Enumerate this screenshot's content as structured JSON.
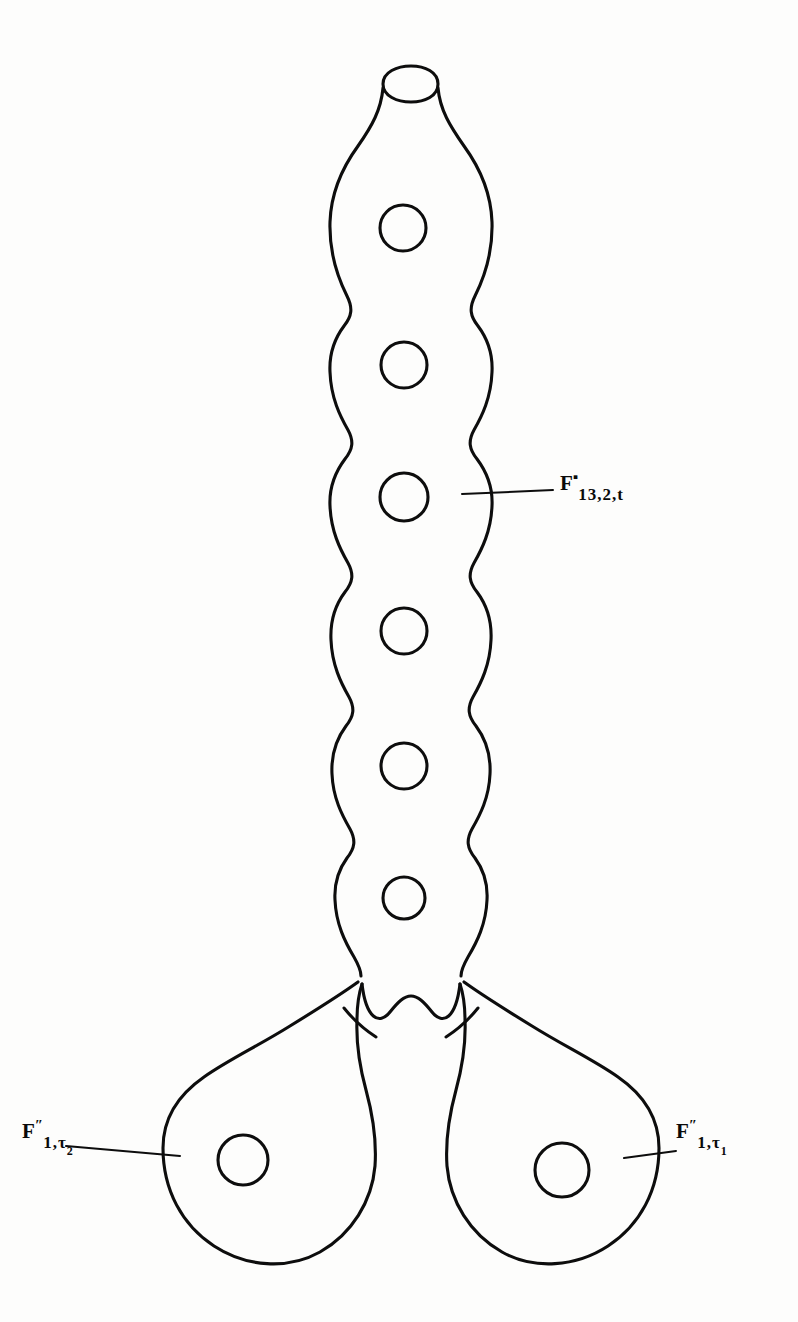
{
  "figure": {
    "kind": "riemann-surface-pair-of-pants-diagram",
    "background_color": "#fdfdfc",
    "ink_color": "#0d0d0d"
  },
  "labels": {
    "tube": {
      "name": "upper-tube-label",
      "base": "F",
      "superscript": "▪",
      "subscript": "13,2,t",
      "full_text": "F▪ 13,2,t"
    },
    "left_lobe": {
      "name": "left-lobe-label",
      "base": "F",
      "superscript": "″",
      "subscript": "1,τ",
      "subscript_index": "2",
      "full_text": "F″ 1,τ₂"
    },
    "right_lobe": {
      "name": "right-lobe-label",
      "base": "F",
      "superscript": "″",
      "subscript": "1,τ",
      "subscript_index": "1",
      "full_text": "F″ 1,τ₁"
    }
  },
  "geometry": {
    "tube_holes": [
      {
        "cx": 403,
        "cy": 228,
        "r": 23
      },
      {
        "cx": 404,
        "cy": 365,
        "r": 23
      },
      {
        "cx": 404,
        "cy": 497,
        "r": 24
      },
      {
        "cx": 404,
        "cy": 631,
        "r": 23
      },
      {
        "cx": 404,
        "cy": 766,
        "r": 23
      },
      {
        "cx": 404,
        "cy": 898,
        "r": 21
      }
    ],
    "lobe_holes": [
      {
        "cx": 243,
        "cy": 1160,
        "r": 25
      },
      {
        "cx": 562,
        "cy": 1170,
        "r": 27
      }
    ],
    "tube_opening": {
      "cx": 410,
      "cy": 84,
      "rx": 27,
      "ry": 11
    },
    "leader_lines": [
      {
        "name": "tube-leader",
        "x1": 462,
        "y1": 494,
        "x2": 552,
        "y2": 490
      },
      {
        "name": "left-lobe-leader",
        "x1": 70,
        "y1": 1147,
        "x2": 178,
        "y2": 1155
      },
      {
        "name": "right-lobe-leader",
        "x1": 626,
        "y1": 1157,
        "x2": 672,
        "y2": 1152
      }
    ]
  }
}
